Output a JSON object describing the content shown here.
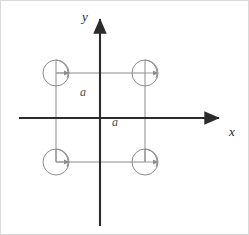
{
  "figure": {
    "background_color": "#ffffff",
    "border_color": "#d9d9d9",
    "width": 249,
    "height": 235
  },
  "axes": {
    "x_label": "x",
    "y_label": "y",
    "color": "#2b2b2b",
    "stroke_width": 2.1,
    "x_axis": {
      "x1": 18,
      "y1": 117,
      "x2": 222,
      "y2": 117,
      "arrow": "right"
    },
    "y_axis": {
      "x1": 99,
      "y1": 225,
      "x2": 99,
      "y2": 14,
      "arrow": "up"
    },
    "origin": {
      "x": 99,
      "y": 117
    }
  },
  "square": {
    "color": "#8c8c8c",
    "stroke_width": 1,
    "side_length_label": "a",
    "left": 55,
    "top": 72,
    "right": 144,
    "bottom": 161,
    "side_px": 89
  },
  "dimension_labels": [
    {
      "text": "a",
      "orientation": "vertical-side",
      "x": 83,
      "y": 92
    },
    {
      "text": "a",
      "orientation": "horizontal-side",
      "x": 115,
      "y": 122
    }
  ],
  "loops": [
    {
      "name": "top-left-loop",
      "position": "top-left",
      "center_x": 55,
      "center_y": 72,
      "radius": 13,
      "color": "#8c8c8c",
      "arrow_direction": "clockwise",
      "arrow_tip": "right"
    },
    {
      "name": "top-right-loop",
      "position": "top-right",
      "center_x": 144,
      "center_y": 72,
      "radius": 13,
      "color": "#8c8c8c",
      "arrow_direction": "clockwise",
      "arrow_tip": "right"
    },
    {
      "name": "bottom-left-loop",
      "position": "bottom-left",
      "center_x": 55,
      "center_y": 161,
      "radius": 13,
      "color": "#8c8c8c",
      "arrow_direction": "clockwise",
      "arrow_tip": "right"
    },
    {
      "name": "bottom-right-loop",
      "position": "bottom-right",
      "center_x": 144,
      "center_y": 161,
      "radius": 13,
      "color": "#8c8c8c",
      "arrow_direction": "clockwise",
      "arrow_tip": "right"
    }
  ]
}
